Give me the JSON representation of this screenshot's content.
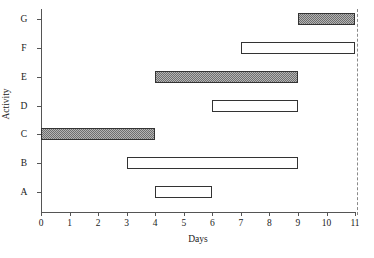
{
  "chart_data": {
    "type": "bar",
    "subtype": "gantt",
    "title": "",
    "xlabel": "Days",
    "ylabel": "Activity",
    "xlim": [
      0,
      11
    ],
    "ylim_categories": [
      "A",
      "B",
      "C",
      "D",
      "E",
      "F",
      "G"
    ],
    "x_ticks": [
      0,
      1,
      2,
      3,
      4,
      5,
      6,
      7,
      8,
      9,
      10,
      11
    ],
    "x_tick_labels": [
      "0",
      "1",
      "2",
      "3",
      "4",
      "5",
      "6",
      "7",
      "8",
      "9",
      "10",
      "11"
    ],
    "y_tick_labels": [
      "A",
      "B",
      "C",
      "D",
      "E",
      "F",
      "G"
    ],
    "grid": false,
    "legend": "none",
    "categories": [
      "G",
      "F",
      "E",
      "D",
      "C",
      "B",
      "A"
    ],
    "tasks": [
      {
        "activity": "G",
        "start": 9,
        "end": 11,
        "duration": 2,
        "style": "shaded"
      },
      {
        "activity": "F",
        "start": 7,
        "end": 11,
        "duration": 4,
        "style": "open"
      },
      {
        "activity": "E",
        "start": 4,
        "end": 9,
        "duration": 5,
        "style": "shaded"
      },
      {
        "activity": "D",
        "start": 6,
        "end": 9,
        "duration": 3,
        "style": "open"
      },
      {
        "activity": "C",
        "start": 0,
        "end": 4,
        "duration": 4,
        "style": "shaded"
      },
      {
        "activity": "B",
        "start": 3,
        "end": 9,
        "duration": 6,
        "style": "open"
      },
      {
        "activity": "A",
        "start": 4,
        "end": 6,
        "duration": 2,
        "style": "open"
      }
    ],
    "annotations": [
      {
        "name": "project-deadline",
        "type": "vertical-dashed-line",
        "x": 11.1
      }
    ],
    "colors": {
      "bar_outline": "#333333",
      "bar_open_fill": "#ffffff",
      "bar_shaded_fill": "#b4b4b4",
      "bar_shaded_hatch": "#6e6e6e",
      "axis": "#555555",
      "deadline_line": "#8a8a8a",
      "background": "#ffffff",
      "text": "#1a1a1a"
    }
  }
}
